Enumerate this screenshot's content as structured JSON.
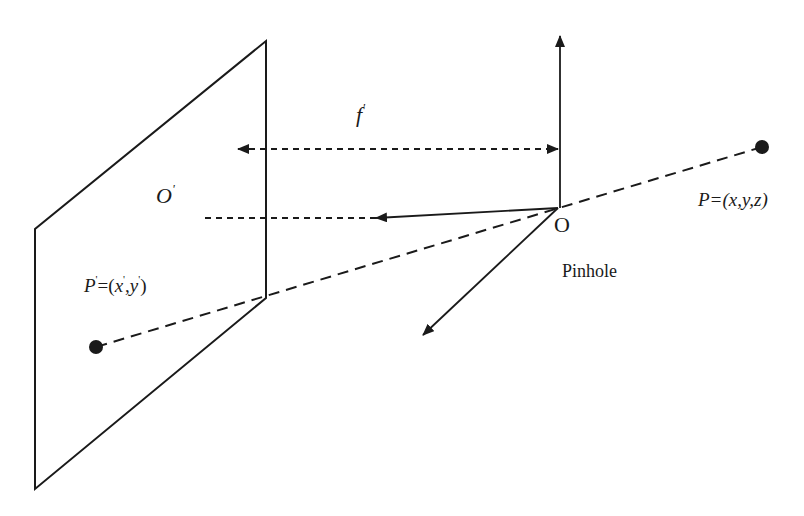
{
  "colors": {
    "stroke": "#1a1a1a",
    "background": "#ffffff"
  },
  "labels": {
    "focal_length": {
      "base": "f",
      "prime": "'"
    },
    "image_center": {
      "base": "O",
      "prime": "'"
    },
    "pinhole_origin": "O",
    "pinhole_caption": "Pinhole",
    "world_point": "P=(x,y,z)",
    "image_point": {
      "p": "P",
      "p_prime": "'",
      "eq_open": "=(",
      "x": "x",
      "x_prime": "'",
      "comma": ",",
      "y": "y",
      "y_prime": "'",
      "close": ")"
    }
  },
  "geometry": {
    "image_plane": [
      [
        266,
        41
      ],
      [
        266,
        298
      ],
      [
        35,
        489
      ],
      [
        35,
        229
      ]
    ],
    "origin": [
      558,
      208
    ],
    "world_point": [
      762,
      147
    ],
    "image_point": [
      96,
      347
    ]
  }
}
